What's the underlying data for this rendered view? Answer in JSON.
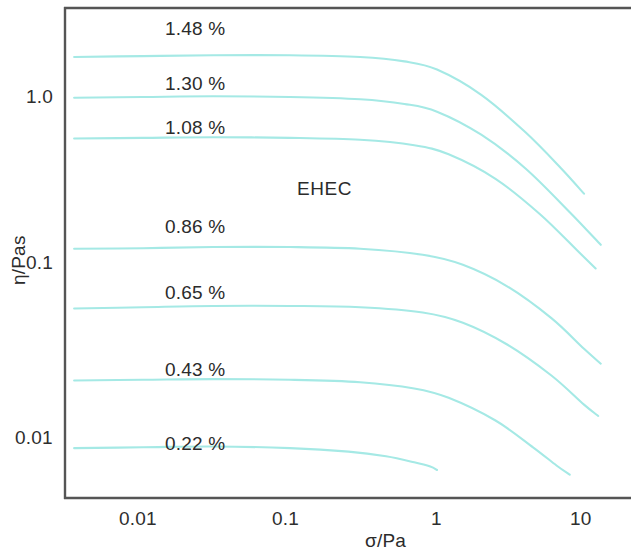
{
  "chart_data": {
    "type": "line",
    "title": "",
    "annotation": "EHEC",
    "xlabel": "σ/Pa",
    "ylabel": "η/Pas",
    "xscale": "log",
    "yscale": "log",
    "xlim": [
      0.0033,
      20
    ],
    "ylim": [
      0.0063,
      2.6
    ],
    "xticks": [
      0.01,
      0.1,
      1,
      10
    ],
    "xticklabels": [
      "0.01",
      "0.1",
      "1",
      "10"
    ],
    "yticks": [
      1.0,
      0.1,
      0.01
    ],
    "yticklabels": [
      "1.0",
      "0.1",
      "0.01"
    ],
    "grid": false,
    "legend": "inline-labels",
    "line_color": "#a5e9e5",
    "series": [
      {
        "name": "1.48 %",
        "label": "1.48 %",
        "x": [
          0.0034,
          0.01,
          0.03,
          0.1,
          0.3,
          0.6,
          1.0,
          2.0,
          4.0,
          7.0,
          10.0
        ],
        "y": [
          1.72,
          1.74,
          1.76,
          1.76,
          1.72,
          1.62,
          1.45,
          1.03,
          0.62,
          0.38,
          0.27
        ]
      },
      {
        "name": "1.30 %",
        "label": "1.30 %",
        "x": [
          0.0034,
          0.01,
          0.03,
          0.1,
          0.3,
          0.6,
          1.0,
          2.0,
          4.0,
          8.0,
          13.0
        ],
        "y": [
          0.99,
          1.0,
          1.01,
          1.0,
          0.97,
          0.91,
          0.82,
          0.6,
          0.38,
          0.21,
          0.135
        ]
      },
      {
        "name": "1.08 %",
        "label": "1.08 %",
        "x": [
          0.0034,
          0.01,
          0.03,
          0.1,
          0.3,
          0.7,
          1.2,
          2.5,
          5.0,
          9.0,
          12.0
        ],
        "y": [
          0.57,
          0.575,
          0.58,
          0.575,
          0.56,
          0.52,
          0.46,
          0.33,
          0.205,
          0.125,
          0.098
        ]
      },
      {
        "name": "0.86 %",
        "label": "0.86 %",
        "x": [
          0.0034,
          0.01,
          0.03,
          0.1,
          0.3,
          0.8,
          1.5,
          3.0,
          6.0,
          10.0,
          13.0
        ],
        "y": [
          0.128,
          0.129,
          0.131,
          0.131,
          0.128,
          0.118,
          0.103,
          0.077,
          0.05,
          0.033,
          0.027
        ]
      },
      {
        "name": "0.65 %",
        "label": "0.65 %",
        "x": [
          0.0034,
          0.01,
          0.03,
          0.1,
          0.3,
          0.8,
          1.5,
          3.0,
          6.0,
          10.0,
          12.5
        ],
        "y": [
          0.057,
          0.058,
          0.059,
          0.059,
          0.058,
          0.054,
          0.047,
          0.035,
          0.023,
          0.0155,
          0.0133
        ]
      },
      {
        "name": "0.43 %",
        "label": "0.43 %",
        "x": [
          0.0034,
          0.01,
          0.03,
          0.1,
          0.3,
          0.7,
          1.2,
          2.5,
          4.5,
          6.5,
          8.0
        ],
        "y": [
          0.0215,
          0.0217,
          0.0219,
          0.0217,
          0.021,
          0.0193,
          0.017,
          0.0125,
          0.0087,
          0.0068,
          0.006
        ]
      },
      {
        "name": "0.22 %",
        "label": "0.22 %",
        "x": [
          0.0034,
          0.01,
          0.03,
          0.1,
          0.25,
          0.45,
          0.7,
          0.9,
          1.0
        ],
        "y": [
          0.0086,
          0.0087,
          0.0088,
          0.0086,
          0.0082,
          0.0077,
          0.0071,
          0.0067,
          0.0064
        ]
      }
    ]
  },
  "axes": {
    "xlabel": "σ/Pa",
    "ylabel": "η/Pas",
    "xticklabels": [
      "0.01",
      "0.1",
      "1",
      "10"
    ],
    "yticklabels": [
      "1.0",
      "0.1",
      "0.01"
    ]
  },
  "labels": {
    "s1": "1.48 %",
    "s2": "1.30 %",
    "s3": "1.08 %",
    "s4": "0.86 %",
    "s5": "0.65 %",
    "s6": "0.43 %",
    "s7": "0.22 %",
    "annotation": "EHEC"
  },
  "colors": {
    "line": "#a5e9e5",
    "axis": "#555555",
    "text": "#2b2b2b"
  }
}
